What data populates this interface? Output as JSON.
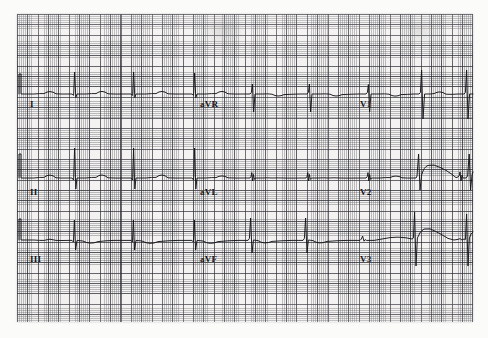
{
  "document": {
    "kind": "ecg-strip-scan",
    "title": "12-lead ECG rhythm strip (scanned graph paper)",
    "paper_color": "#f3f2f1",
    "trace_color": "#16161a",
    "fine_grid_color": "#5a5a5f",
    "bold_grid_color": "#282832",
    "grid": {
      "fine_square_px": 2.07,
      "bold_square_px": 10.35,
      "left": 17,
      "top": 14,
      "width": 456,
      "height": 308
    }
  },
  "leads": [
    {
      "id": "I",
      "label": "I",
      "label_x": 30,
      "label_y": 99,
      "row": 1,
      "column": 1,
      "baseline_y": 94
    },
    {
      "id": "aVR",
      "label": "aVR",
      "label_x": 200,
      "label_y": 99,
      "row": 1,
      "column": 2,
      "baseline_y": 94
    },
    {
      "id": "V1",
      "label": "V1",
      "label_x": 360,
      "label_y": 99,
      "row": 1,
      "column": 3,
      "baseline_y": 94
    },
    {
      "id": "II",
      "label": "II",
      "label_x": 30,
      "label_y": 187,
      "row": 2,
      "column": 1,
      "baseline_y": 178
    },
    {
      "id": "aVL",
      "label": "aVL",
      "label_x": 200,
      "label_y": 187,
      "row": 2,
      "column": 2,
      "baseline_y": 178
    },
    {
      "id": "V2",
      "label": "V2",
      "label_x": 360,
      "label_y": 187,
      "row": 2,
      "column": 3,
      "baseline_y": 178
    },
    {
      "id": "III",
      "label": "III",
      "label_x": 30,
      "label_y": 254,
      "row": 3,
      "column": 1,
      "baseline_y": 240
    },
    {
      "id": "aVF",
      "label": "aVF",
      "label_x": 200,
      "label_y": 254,
      "row": 3,
      "column": 2,
      "baseline_y": 240
    },
    {
      "id": "V3",
      "label": "V3",
      "label_x": 360,
      "label_y": 254,
      "row": 3,
      "column": 3,
      "baseline_y": 240
    }
  ],
  "traces": {
    "row1": {
      "name": "row-1-trace-I-aVR-V1",
      "baseline_y": 94,
      "d": "M19,94 L19,74 L21,74 L21,94 L34,94 Q40,93.4 44,93.6 Q50,89.5 56,93.8 Q62,94.2 68,94 L72,94 L73.6,95.4 L74.6,72 L75.8,97.6 L77,94 L86,94 Q92,93.4 96,93.6 Q102,89.2 108,93.8 Q116,94.2 124,94 L131,94 L132.6,95.4 L133.6,72 L134.8,97.6 L136,94 L146,94 Q152,93.4 156,93.6 Q162,89.2 168,93.8 Q176,94.2 184,94 L192,94 L193.6,95.4 L194.6,73 L195.8,97.6 L197,94 L206,94 Q212,93.4 216,93.6 Q222,89.2 228,93.8 Q236,94.2 244,94 L250,94 L251.4,92.4 L252.4,84 L253.6,112 L255,94 L262,94 Q268,93.6 272,94.2 Q278,97.6 284,94.6 Q292,94.2 300,94 L307,94 L308.4,92.4 L309.4,84 L310.6,112 L312,94 L320,94 Q326,93.6 330,94.2 Q336,97.6 342,94.6 Q350,94.2 358,94 L366,94 L367.4,92.4 L368.4,84.5 L369.6,112 L371,94 L379,94 Q385,93.6 389,94.2 Q395,97.8 401,94.6 Q408,94.4 414,94 L419,94 L420.4,92.6 L421.6,70 L423,119 L424.6,94 L430,94 L434,93.6 Q440,90 446,94.2 Q452,94.6 458,94 L464,94 L465.4,92.6 L466.6,70 L468,119 L469.6,94 L473,94"
    },
    "row2": {
      "name": "row-2-trace-II-aVL-V2",
      "baseline_y": 178,
      "d": "M19,178 L19,154 L21,154 L21,178 L34,178 Q40,177.2 44,177.4 Q50,172.6 56,177.8 Q62,178.2 68,178 L72,178 L73.6,180 L74.6,148 L75.8,189 L77,178 L86,178 Q92,177.2 96,177.4 Q102,172.4 108,177.8 Q116,178.2 124,178 L131,178 L132.6,180 L133.6,148 L134.8,189 L136,178 L146,178 Q152,177.2 156,177.4 Q162,172.4 168,177.8 Q176,178.2 184,178 L192,178 L193.6,180 L194.6,148 L195.8,189 L197,178 L206,178 Q212,177.4 216,177.6 Q222,174.2 228,177.8 Q236,178.2 244,178 L250,178 L251,176.4 L251.8,172.6 L252.6,181 L253.4,174.4 L254.4,179.4 L255.4,178 L262,178 Q268,177.6 272,178 Q278,177.8 284,178 Q292,178.2 300,178 L306,178 L307,176.4 L307.8,172.6 L308.6,181 L309.4,174.4 L310.4,179.4 L311.4,178 L318,178 Q324,177.6 328,178 Q334,177.6 340,178 Q350,178.2 360,178 L366,178 L367.2,176.6 L368,172.6 L368.8,181 L369.6,174.4 L370.6,179.4 L371.6,178 L380,178 Q386,177.4 390,177.6 Q396,174.4 402,177.8 Q408,178.2 412,178 L416,178 L417,176 L418.6,154 L420,190 L421.6,175 Q424,166.6 428,165.4 Q434,163.8 440,167.4 Q446,169.8 452,174.4 L456,177.6 L458,177 L459.2,175.6 L460,172 L461,181 L462,175 L463,178 L466,178 L467.6,176 L469.2,154 L470.6,190 L472,175 L473,172"
    },
    "row3": {
      "name": "row-3-trace-III-aVF-V3",
      "baseline_y": 240,
      "d": "M19,240 L19,219 L21,219 L21,240 L34,240 Q40,240.6 44,240.4 Q50,238 56,240.4 Q62,240.6 68,240.4 L72,240.4 L73.4,242 L74.4,220 L75.6,250 L77,240.4 L83,241 Q90,245 98,241.6 Q106,240.6 114,240.4 L124,240.4 L131,240.4 L132.4,242 L133.4,220 L134.6,250 L136,240.4 L142,241 Q150,245.4 158,241.6 Q168,240.6 178,240.4 L192,240.4 L193.4,242 L194.4,220 L195.6,250 L197,240.4 L203,241 Q210,245.4 218,241.6 Q228,240.6 238,240.4 L248,240.4 L249.4,238.4 L250.6,218 L252,253 L253.4,240 L258,240.6 Q264,244.8 272,241.4 Q282,240.6 292,240.4 L303,240.4 L304.4,238.4 L305.6,218 L307,253 L308.4,240 L313,240.6 Q319,244.8 327,241.4 Q337,240.6 347,240.4 L360,240.4 L361.4,239 L362.6,236 L364,241.2 L365.2,239.6 L366.4,240.4 L374,240.4 Q382,239 390,237.6 Q398,236.6 406,237.8 L412,239 L413.4,238 L414.6,212 L416,266 L417.4,238 Q420,230.6 424,229 Q430,227.4 436,231.6 Q442,234.6 448,238.4 L454,240 L458,239.4 L460,238.6 L462,240 L464,239 L465.4,239.6 L466.6,214 L468,266 L469.4,238 L471,234 L473,232"
    }
  }
}
